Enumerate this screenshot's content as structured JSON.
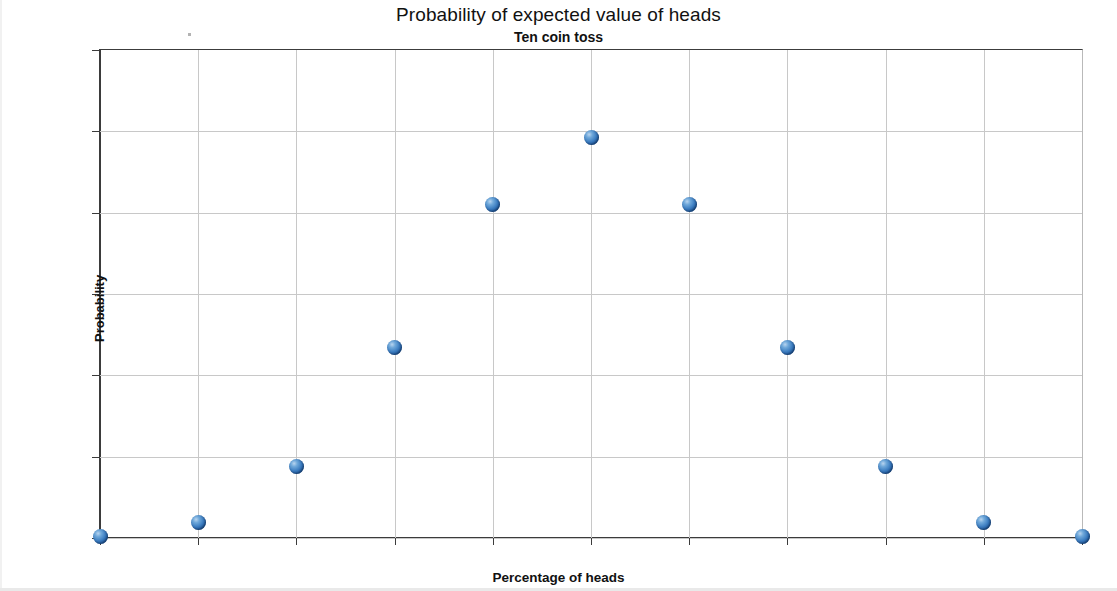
{
  "chart_data": {
    "type": "scatter",
    "title": "Probability of expected value of heads",
    "subtitle": "Ten coin toss",
    "xlabel": "Percentage of heads",
    "ylabel": "Probability",
    "xlim": [
      0,
      100
    ],
    "ylim": [
      0,
      30
    ],
    "grid": true,
    "legend": "none",
    "x_tick_labels": [
      "0.00%",
      "10.00%",
      "20.00%",
      "30.00%",
      "40.00%",
      "50.00%",
      "60.00%",
      "70.00%",
      "80.00%",
      "90.00%",
      "100.00%"
    ],
    "x_tick_values": [
      0,
      10,
      20,
      30,
      40,
      50,
      60,
      70,
      80,
      90,
      100
    ],
    "y_tick_labels": [
      "0.00%",
      "5.00%",
      "10.00%",
      "15.00%",
      "20.00%",
      "25.00%",
      "30.00%"
    ],
    "y_tick_values": [
      0,
      5,
      10,
      15,
      20,
      25,
      30
    ],
    "series": [
      {
        "name": "Probability",
        "marker": "sphere",
        "color": "#3b7cc0",
        "x": [
          0,
          10,
          20,
          30,
          40,
          50,
          60,
          70,
          80,
          90,
          100
        ],
        "y": [
          0.1,
          0.98,
          4.39,
          11.72,
          20.51,
          24.61,
          20.51,
          11.72,
          4.39,
          0.98,
          0.1
        ]
      }
    ]
  },
  "colors": {
    "marker": "#3b7cc0",
    "axis": "#3b3b3b",
    "grid": "#c8c8c8",
    "text": "#111111",
    "background": "#ffffff"
  }
}
